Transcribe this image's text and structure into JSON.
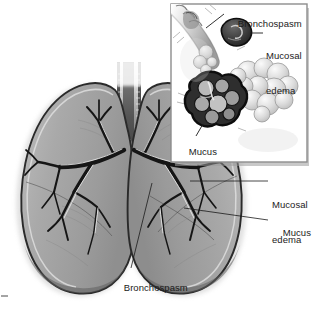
{
  "figure": {
    "background_color": "#ffffff",
    "ink_color": "#1b1b1b",
    "lung_fill_color": "#a8a8a8",
    "lung_shadow_color": "#8a8a8a",
    "airway_light_color": "#d8d8d8",
    "alveoli_color": "#cfcfcf"
  },
  "main_diagram": {
    "name": "lungs-with-bronchial-tree",
    "labels": [
      {
        "id": "mucosal-edema",
        "text_line_1": "Mucosal",
        "text_line_2": "edema",
        "x": 272,
        "y": 184
      },
      {
        "id": "mucus",
        "text_line_1": "Mucus",
        "text_line_2": "",
        "x": 272,
        "y": 222
      },
      {
        "id": "bronchospasm",
        "text_line_1": "Bronchospasm",
        "text_line_2": "",
        "x": 113,
        "y": 277
      }
    ]
  },
  "inset_panel": {
    "name": "bronchiole-detail-inset",
    "frame": {
      "x": 170,
      "y": 3,
      "width": 138,
      "height": 160
    },
    "border_color": "#8d8d8d",
    "labels": [
      {
        "id": "inset-bronchospasm",
        "text_line_1": "Bronchospasm",
        "text_line_2": "",
        "x": 227,
        "y": 11
      },
      {
        "id": "inset-mucosal-edema",
        "text_line_1": "Mucosal",
        "text_line_2": "edema",
        "x": 266,
        "y": 33
      },
      {
        "id": "inset-mucus",
        "text_line_1": "Mucus",
        "text_line_2": "",
        "x": 178,
        "y": 139
      }
    ]
  },
  "corner_mark": {
    "name": "crop-tick-mark",
    "x": 2,
    "y": 295
  }
}
